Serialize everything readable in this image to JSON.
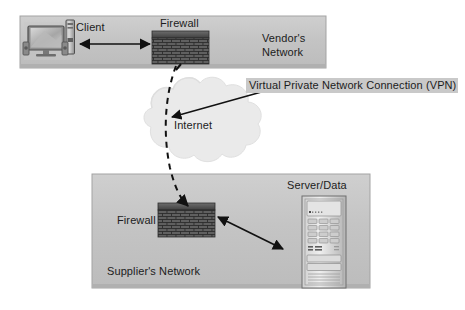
{
  "diagram": {
    "background_color": "#ffffff",
    "zone_fill": "#c2c2c2",
    "zone_border": "#9a9a9a",
    "firewall_brick_color": "#5a5a5a",
    "firewall_cap_color": "#4a4a4a",
    "cloud_fill": "#eaeaea",
    "line_color": "#111111",
    "vpn_highlight_color": "#c9c9c9"
  },
  "zones": [
    {
      "id": "vendor",
      "label_line1": "Vendor's",
      "label_line2": "Network"
    },
    {
      "id": "supplier",
      "label": "Supplier's  Network"
    }
  ],
  "nodes": {
    "client": {
      "label": "Client",
      "icon": "desktop-computer-icon"
    },
    "vendor_firewall": {
      "label": "Firewall",
      "icon": "brick-wall-firewall-icon"
    },
    "supplier_firewall": {
      "label": "Firewall",
      "icon": "brick-wall-firewall-icon"
    },
    "internet": {
      "label": "Internet",
      "icon": "cloud-icon"
    },
    "server": {
      "label": "Server/Data",
      "icon": "server-rack-icon"
    }
  },
  "connections": {
    "vpn": {
      "label": "Virtual Private Network Connection (VPN)",
      "style": "dashed"
    },
    "client_to_firewall": {
      "style": "solid",
      "arrows": "both"
    },
    "firewall_to_server": {
      "style": "solid",
      "arrows": "both"
    }
  }
}
